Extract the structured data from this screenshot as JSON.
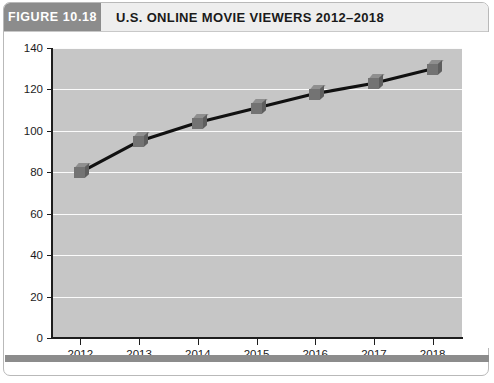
{
  "figure": {
    "badge": "FIGURE 10.18",
    "title": "U.S. ONLINE MOVIE VIEWERS 2012–2018"
  },
  "colors": {
    "badge_background": "#8c8c8c",
    "header_background": "#eeeeee",
    "plot_background": "#c6c6c6",
    "gridline": "#fbfbfb",
    "axis": "#1d1d1d",
    "line": "#111111",
    "marker_face": "#737373",
    "marker_top": "#8f8f8f",
    "marker_side": "#5e5e5e",
    "footer_bar": "#8c8c8c"
  },
  "chart_data": {
    "type": "line",
    "title": "U.S. ONLINE MOVIE VIEWERS 2012–2018",
    "xlabel": "",
    "ylabel": "",
    "categories": [
      "2012",
      "2013",
      "2014",
      "2015",
      "2016",
      "2017",
      "2018"
    ],
    "values": [
      80,
      95,
      104,
      111,
      118,
      123,
      130
    ],
    "x": [
      2012,
      2013,
      2014,
      2015,
      2016,
      2017,
      2018
    ],
    "ylim": [
      0,
      140
    ],
    "yticks": [
      0,
      20,
      40,
      60,
      80,
      100,
      120,
      140
    ],
    "ytick_labels": [
      "0",
      "20",
      "40",
      "60",
      "80",
      "100",
      "120",
      "140"
    ],
    "xtick_labels": [
      "2012",
      "2013",
      "2014",
      "2015",
      "2016",
      "2017",
      "2018"
    ],
    "grid": true,
    "grid_axis": "y",
    "legend": false,
    "legend_position": "none",
    "marker": "cube",
    "series": [
      {
        "name": "U.S. online movie viewers",
        "values": [
          80,
          95,
          104,
          111,
          118,
          123,
          130
        ]
      }
    ]
  }
}
